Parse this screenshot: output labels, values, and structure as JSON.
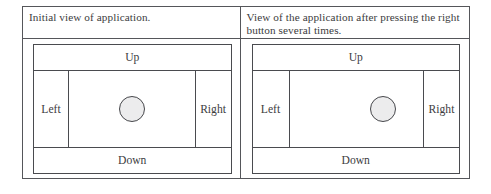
{
  "figure": {
    "type": "two-panel-comparison-table",
    "border_color": "#55565a",
    "panels": [
      {
        "id": "initial",
        "caption": "Initial view of application.",
        "app": {
          "buttons": {
            "up": "Up",
            "down": "Down",
            "left": "Left",
            "right": "Right"
          },
          "ball": {
            "shape": "circle",
            "fill_color": "#ececed",
            "outline_color": "#46474b",
            "diameter_px": 26,
            "horizontal_position_pct": 50,
            "vertical_position_pct": 50
          }
        }
      },
      {
        "id": "after-right-presses",
        "caption": "View of the application after pressing the right button several times.",
        "app": {
          "buttons": {
            "up": "Up",
            "down": "Down",
            "left": "Left",
            "right": "Right"
          },
          "ball": {
            "shape": "circle",
            "fill_color": "#ececed",
            "outline_color": "#46474b",
            "diameter_px": 26,
            "horizontal_position_pct": 70,
            "vertical_position_pct": 50
          }
        }
      }
    ]
  }
}
